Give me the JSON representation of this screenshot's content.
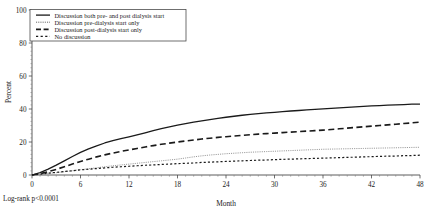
{
  "chart_data": {
    "type": "line",
    "title": "",
    "subtitle": "",
    "xlabel": "Month",
    "ylabel": "Percent",
    "xlim": [
      0,
      48
    ],
    "ylim": [
      0,
      100
    ],
    "xticks": [
      0,
      6,
      12,
      18,
      24,
      30,
      36,
      42,
      48
    ],
    "yticks": [
      0,
      20,
      40,
      60,
      80,
      100
    ],
    "xtick_labels": [
      "0",
      "6",
      "12",
      "18",
      "24",
      "30",
      "36",
      "42",
      "48"
    ],
    "ytick_labels": [
      "0",
      "20",
      "40",
      "60",
      "80",
      "100"
    ],
    "grid": false,
    "legend_position": "top-left",
    "annotations": [
      {
        "name": "log-rank-annotation",
        "text": "Log-rank p<0.0001",
        "x_month": 0,
        "y_percent": -14
      }
    ],
    "x": [
      0,
      1,
      2,
      3,
      4,
      5,
      6,
      7,
      8,
      9,
      10,
      11,
      12,
      13,
      14,
      15,
      16,
      17,
      18,
      19,
      20,
      21,
      22,
      23,
      24,
      25,
      26,
      27,
      28,
      29,
      30,
      31,
      32,
      33,
      34,
      35,
      36,
      37,
      38,
      39,
      40,
      41,
      42,
      43,
      44,
      45,
      46,
      47,
      48
    ],
    "series": [
      {
        "name": "Discussion both pre- and post dialysis start",
        "style": "solid",
        "color": "#1a1a1a",
        "width": 1.3,
        "values": [
          0,
          1.5,
          3.6,
          6.0,
          8.6,
          11.2,
          13.7,
          15.8,
          17.7,
          19.4,
          20.8,
          22.0,
          23.1,
          24.3,
          25.6,
          26.9,
          28.1,
          29.2,
          30.2,
          31.1,
          32.0,
          32.8,
          33.6,
          34.3,
          35.0,
          35.6,
          36.2,
          36.7,
          37.2,
          37.6,
          38.0,
          38.4,
          38.8,
          39.1,
          39.5,
          39.8,
          40.1,
          40.4,
          40.7,
          41.0,
          41.3,
          41.6,
          41.9,
          42.1,
          42.3,
          42.5,
          42.7,
          42.9,
          43.0
        ]
      },
      {
        "name": "Discussion pre-dialysis start only",
        "style": "fine-dotted",
        "color": "#8c8c8c",
        "width": 0.9,
        "values": [
          0,
          0.4,
          0.9,
          1.4,
          2.0,
          2.6,
          3.2,
          3.8,
          4.4,
          5.0,
          5.6,
          6.1,
          6.6,
          7.1,
          7.6,
          8.1,
          8.6,
          9.1,
          9.6,
          10.3,
          11.0,
          11.6,
          12.1,
          12.5,
          12.9,
          13.2,
          13.5,
          13.8,
          14.0,
          14.2,
          14.4,
          14.6,
          14.8,
          15.0,
          15.2,
          15.4,
          15.6,
          15.7,
          15.8,
          15.9,
          16.0,
          16.1,
          16.2,
          16.3,
          16.4,
          16.5,
          16.6,
          16.7,
          16.8
        ]
      },
      {
        "name": "Discussion post-dialysis start only",
        "style": "dashed",
        "color": "#1a1a1a",
        "width": 1.6,
        "values": [
          0,
          0.8,
          2.0,
          3.4,
          5.0,
          6.6,
          8.2,
          9.6,
          11.0,
          12.2,
          13.3,
          14.3,
          15.2,
          16.1,
          17.0,
          17.8,
          18.6,
          19.3,
          20.0,
          20.6,
          21.2,
          21.8,
          22.3,
          22.8,
          23.2,
          23.6,
          24.0,
          24.4,
          24.8,
          25.1,
          25.4,
          25.7,
          26.0,
          26.3,
          26.6,
          26.9,
          27.2,
          27.6,
          28.0,
          28.4,
          28.8,
          29.2,
          29.6,
          30.0,
          30.4,
          30.8,
          31.2,
          31.6,
          32.0
        ]
      },
      {
        "name": "No discussion",
        "style": "dotted",
        "color": "#1a1a1a",
        "width": 1.2,
        "values": [
          0,
          0.5,
          1.1,
          1.6,
          2.1,
          2.6,
          3.1,
          3.5,
          3.9,
          4.3,
          4.7,
          5.0,
          5.3,
          5.6,
          5.9,
          6.1,
          6.4,
          6.6,
          6.9,
          7.1,
          7.3,
          7.6,
          7.8,
          8.0,
          8.2,
          8.4,
          8.6,
          8.8,
          9.0,
          9.1,
          9.3,
          9.5,
          9.6,
          9.8,
          9.9,
          10.1,
          10.2,
          10.4,
          10.5,
          10.7,
          10.8,
          11.0,
          11.1,
          11.3,
          11.4,
          11.5,
          11.7,
          11.8,
          12.0
        ]
      }
    ],
    "legend": [
      {
        "label": "Discussion both pre- and post dialysis start",
        "style": "solid",
        "color": "#1a1a1a"
      },
      {
        "label": "Discussion pre-dialysis start only",
        "style": "fine-dotted",
        "color": "#555555"
      },
      {
        "label": "Discussion post-dialysis start only",
        "style": "dashed",
        "color": "#1a1a1a"
      },
      {
        "label": "No discussion",
        "style": "dotted",
        "color": "#1a1a1a"
      }
    ]
  }
}
